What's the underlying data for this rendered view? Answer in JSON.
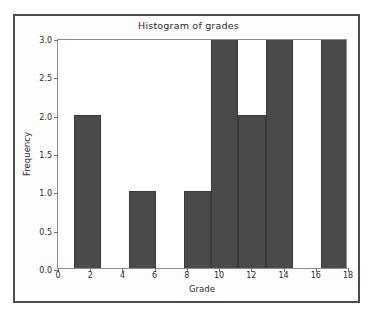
{
  "figure": {
    "title": "Histogram of grades",
    "background_color": "#ffffff",
    "frame_color": "#4b4b52"
  },
  "axes": {
    "xlabel": "Grade",
    "ylabel": "Frequency",
    "xticks": [
      0,
      2,
      4,
      6,
      8,
      10,
      12,
      14,
      16,
      18
    ],
    "xtick_labels": [
      "0",
      "2",
      "4",
      "6",
      "8",
      "10",
      "12",
      "14",
      "16",
      "18"
    ],
    "yticks": [
      0.0,
      0.5,
      1.0,
      1.5,
      2.0,
      2.5,
      3.0
    ],
    "ytick_labels": [
      "0.0",
      "0.5",
      "1.0",
      "1.5",
      "2.0",
      "2.5",
      "3.0"
    ],
    "xlim": [
      0,
      18
    ],
    "ylim": [
      0,
      3
    ]
  },
  "chart_data": {
    "type": "bar",
    "title": "Histogram of grades",
    "xlabel": "Grade",
    "ylabel": "Frequency",
    "xlim": [
      0,
      18
    ],
    "ylim": [
      0,
      3
    ],
    "grid": false,
    "legend": false,
    "bar_color": "#4a4a4a",
    "edge_color": "#3a3a3a",
    "bin_edges": [
      1.0,
      2.7,
      4.4,
      6.1,
      7.8,
      9.5,
      11.2,
      12.9,
      14.6,
      16.3,
      18.0
    ],
    "bin_width": 1.7,
    "categories": [
      "1.0-2.7",
      "2.7-4.4",
      "4.4-6.1",
      "6.1-7.8",
      "7.8-9.5",
      "9.5-11.2",
      "11.2-12.9",
      "12.9-14.6",
      "14.6-16.3",
      "16.3-18.0"
    ],
    "values": [
      2,
      0,
      1,
      0,
      1,
      3,
      2,
      3,
      0,
      3
    ],
    "xtick_labels": [
      "0",
      "2",
      "4",
      "6",
      "8",
      "10",
      "12",
      "14",
      "16",
      "18"
    ],
    "xticks": [
      0,
      2,
      4,
      6,
      8,
      10,
      12,
      14,
      16,
      18
    ],
    "ytick_labels": [
      "0.0",
      "0.5",
      "1.0",
      "1.5",
      "2.0",
      "2.5",
      "3.0"
    ],
    "yticks": [
      0.0,
      0.5,
      1.0,
      1.5,
      2.0,
      2.5,
      3.0
    ]
  }
}
